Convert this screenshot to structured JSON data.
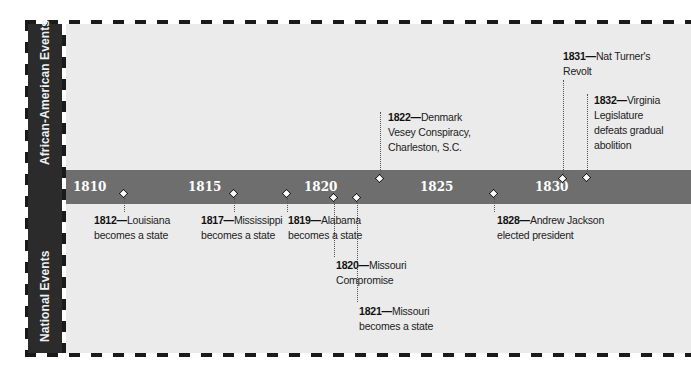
{
  "side_labels": {
    "top": "African-American Events",
    "bottom": "National Events"
  },
  "timeline": {
    "years": [
      {
        "label": "1810",
        "x": 75
      },
      {
        "label": "1815",
        "x": 190
      },
      {
        "label": "1820",
        "x": 305
      },
      {
        "label": "1825",
        "x": 422
      },
      {
        "label": "1830",
        "x": 537
      }
    ]
  },
  "events": {
    "national": [
      {
        "year": "1812",
        "dash": "—",
        "line1": "Louisiana",
        "line2": "becomes a state"
      },
      {
        "year": "1817",
        "dash": "—",
        "line1": "Mississippi",
        "line2": "becomes a state"
      },
      {
        "year": "1819",
        "dash": "—",
        "line1": "Alabama",
        "line2": "becomes a state"
      },
      {
        "year": "1820",
        "dash": "—",
        "line1": "Missouri",
        "line2": "Compromise"
      },
      {
        "year": "1821",
        "dash": "—",
        "line1": "Missouri",
        "line2": "becomes a state"
      },
      {
        "year": "1828",
        "dash": "—",
        "line1": "Andrew Jackson",
        "line2": "elected president"
      }
    ],
    "african_american": [
      {
        "year": "1822",
        "dash": "—",
        "line1": "Denmark",
        "line2": "Vesey Conspiracy,",
        "line3": "Charleston, S.C."
      },
      {
        "year": "1831",
        "dash": "—",
        "line1": "Nat Turner's",
        "line2": "Revolt"
      },
      {
        "year": "1832",
        "dash": "—",
        "line1": "Virginia",
        "line2": "Legislature",
        "line3": "defeats gradual",
        "line4": "abolition"
      }
    ]
  },
  "colors": {
    "band": "#6e6e6e",
    "label_column": "#2b2b2b",
    "background": "#ebebeb"
  }
}
